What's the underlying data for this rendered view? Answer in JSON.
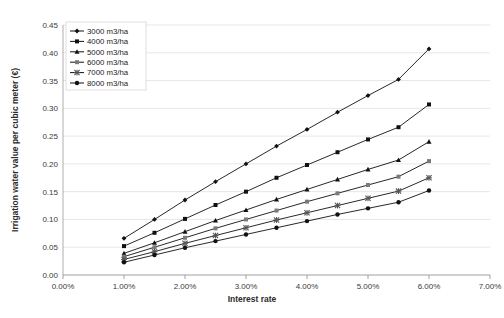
{
  "chart_data": {
    "type": "line",
    "title": "",
    "xlabel": "Interest rate",
    "ylabel": "Irrigation water value per cubic meter (€)",
    "xlim": [
      0.0,
      7.0
    ],
    "ylim": [
      0.0,
      0.45
    ],
    "grid": true,
    "legend_position": "top-left",
    "x_tick_labels": [
      "0.00%",
      "1.00%",
      "2.00%",
      "3.00%",
      "4.00%",
      "5.00%",
      "6.00%",
      "7.00%"
    ],
    "x_tick_values": [
      0.0,
      1.0,
      2.0,
      3.0,
      4.0,
      5.0,
      6.0,
      7.0
    ],
    "y_tick_labels": [
      "0.00",
      "0.05",
      "0.10",
      "0.15",
      "0.20",
      "0.25",
      "0.30",
      "0.35",
      "0.40",
      "0.45"
    ],
    "y_tick_values": [
      0.0,
      0.05,
      0.1,
      0.15,
      0.2,
      0.25,
      0.3,
      0.35,
      0.4,
      0.45
    ],
    "x": [
      1.0,
      1.5,
      2.0,
      2.5,
      3.0,
      3.5,
      4.0,
      4.5,
      5.0,
      5.5,
      6.0
    ],
    "series": [
      {
        "name": "3000 m3/ha",
        "marker": "diamond",
        "color": "#111111",
        "values": [
          0.066,
          0.1,
          0.135,
          0.168,
          0.2,
          0.232,
          0.262,
          0.293,
          0.323,
          0.352,
          0.407
        ]
      },
      {
        "name": "4000 m3/ha",
        "marker": "square",
        "color": "#111111",
        "values": [
          0.052,
          0.076,
          0.101,
          0.126,
          0.15,
          0.175,
          0.198,
          0.221,
          0.244,
          0.266,
          0.307
        ]
      },
      {
        "name": "5000 m3/ha",
        "marker": "triangle",
        "color": "#111111",
        "values": [
          0.039,
          0.058,
          0.078,
          0.098,
          0.117,
          0.136,
          0.154,
          0.172,
          0.19,
          0.207,
          0.24
        ]
      },
      {
        "name": "6000 m3/ha",
        "marker": "square-gray",
        "color": "#7a7a7a",
        "values": [
          0.033,
          0.05,
          0.067,
          0.084,
          0.1,
          0.116,
          0.132,
          0.147,
          0.162,
          0.177,
          0.205
        ]
      },
      {
        "name": "7000 m3/ha",
        "marker": "cross",
        "color": "#555555",
        "values": [
          0.028,
          0.042,
          0.057,
          0.071,
          0.085,
          0.099,
          0.112,
          0.125,
          0.138,
          0.151,
          0.175
        ]
      },
      {
        "name": "8000 m3/ha",
        "marker": "circle",
        "color": "#111111",
        "values": [
          0.023,
          0.036,
          0.049,
          0.061,
          0.073,
          0.085,
          0.097,
          0.109,
          0.12,
          0.131,
          0.152
        ]
      }
    ]
  }
}
